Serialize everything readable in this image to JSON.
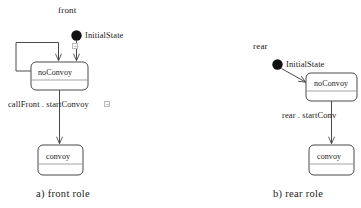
{
  "figure": {
    "type": "uml-state-machine-pair",
    "background_color": "#ffffff",
    "line_color": "#4a4a4a",
    "text_color": "#1a1a1a"
  },
  "diagrams": [
    {
      "id": "front",
      "title": "front",
      "caption": "a) front role",
      "initial": {
        "label": "InitialState",
        "icon": "filled-circle-initial-state"
      },
      "states": [
        {
          "id": "noConvoy",
          "name": "noConvoy"
        },
        {
          "id": "convoy",
          "name": "convoy"
        }
      ],
      "transitions": [
        {
          "from": "InitialState",
          "to": "noConvoy",
          "label": ""
        },
        {
          "from": "noConvoy",
          "to": "noConvoy",
          "label": "",
          "kind": "self-loop"
        },
        {
          "from": "noConvoy",
          "to": "convoy",
          "label": "callFront . startConvoy"
        }
      ],
      "decorations": [
        {
          "name": "note-icon-initial"
        },
        {
          "name": "note-icon-transition"
        }
      ]
    },
    {
      "id": "rear",
      "title": "rear",
      "caption": "b) rear role",
      "initial": {
        "label": "InitialState",
        "icon": "filled-circle-initial-state"
      },
      "states": [
        {
          "id": "noConvoy",
          "name": "noConvoy"
        },
        {
          "id": "convoy",
          "name": "convoy"
        }
      ],
      "transitions": [
        {
          "from": "InitialState",
          "to": "noConvoy",
          "label": ""
        },
        {
          "from": "noConvoy",
          "to": "convoy",
          "label": "rear . startConv"
        }
      ],
      "decorations": []
    }
  ],
  "labels": {
    "front_title": "front",
    "front_initial": "InitialState",
    "front_state_1": "noConvoy",
    "front_state_2": "convoy",
    "front_transition": "callFront . startConvoy",
    "front_caption": "a) front role",
    "rear_title": "rear",
    "rear_initial": "InitialState",
    "rear_state_1": "noConvoy",
    "rear_state_2": "convoy",
    "rear_transition": "rear . startConv",
    "rear_caption": "b) rear role"
  }
}
